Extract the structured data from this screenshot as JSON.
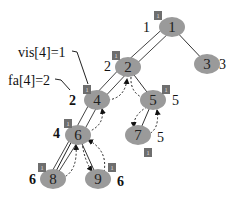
{
  "diagram": {
    "colors": {
      "node_fill": "#9a9a9a",
      "flag_fill": "#6e6e6e",
      "edge": "#333333"
    },
    "nodes": [
      {
        "id": "1",
        "label": "1",
        "cx": 172,
        "cy": 27,
        "side_label": "1",
        "side_x": 143,
        "side_y": 27,
        "bold": false,
        "flag": true,
        "flag_x": 154,
        "flag_y": 11
      },
      {
        "id": "2",
        "label": "2",
        "cx": 128,
        "cy": 67,
        "side_label": "2",
        "side_x": 104,
        "side_y": 66,
        "bold": false,
        "flag": true,
        "flag_x": 112,
        "flag_y": 51
      },
      {
        "id": "3",
        "label": "3",
        "cx": 207,
        "cy": 64,
        "side_label": "3",
        "side_x": 219,
        "side_y": 64,
        "bold": false,
        "flag": false
      },
      {
        "id": "4",
        "label": "4",
        "cx": 97,
        "cy": 100,
        "side_label": "2",
        "side_x": 69,
        "side_y": 100,
        "bold": true,
        "flag": true,
        "flag_x": 83,
        "flag_y": 85
      },
      {
        "id": "5",
        "label": "5",
        "cx": 153,
        "cy": 100,
        "side_label": "5",
        "side_x": 172,
        "side_y": 100,
        "bold": false,
        "flag": true,
        "flag_x": 162,
        "flag_y": 85
      },
      {
        "id": "6",
        "label": "6",
        "cx": 78,
        "cy": 135,
        "side_label": "4",
        "side_x": 53,
        "side_y": 133,
        "bold": true,
        "flag": true,
        "flag_x": 64,
        "flag_y": 119
      },
      {
        "id": "7",
        "label": "7",
        "cx": 138,
        "cy": 135,
        "side_label": "5",
        "side_x": 157,
        "side_y": 137,
        "bold": false,
        "flag": true,
        "flag_x": 144,
        "flag_y": 148
      },
      {
        "id": "8",
        "label": "8",
        "cx": 53,
        "cy": 179,
        "side_label": "6",
        "side_x": 29,
        "side_y": 179,
        "bold": true,
        "flag": true,
        "flag_x": 38,
        "flag_y": 163
      },
      {
        "id": "9",
        "label": "9",
        "cx": 98,
        "cy": 179,
        "side_label": "6",
        "side_x": 117,
        "side_y": 181,
        "bold": true,
        "flag": true,
        "flag_x": 108,
        "flag_y": 163
      }
    ],
    "flag_text": "1",
    "annotations": [
      {
        "id": "vis",
        "text": "vis[4]=1",
        "x": 18,
        "y": 52
      },
      {
        "id": "fa",
        "text": "fa[4]=2",
        "x": 8,
        "y": 80
      }
    ]
  }
}
